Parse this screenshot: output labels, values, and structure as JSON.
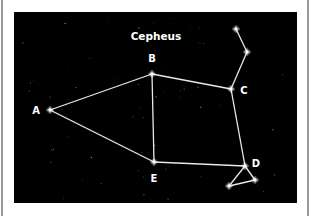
{
  "diagram": {
    "title": "Cepheus",
    "background_color": "#000000",
    "line_color": "#e8e8e8",
    "star_color": "#ffffff",
    "stars": [
      {
        "id": "A",
        "label": "A",
        "x": 50,
        "y": 110,
        "label_x": 36,
        "label_y": 114
      },
      {
        "id": "B",
        "label": "B",
        "x": 152,
        "y": 74,
        "label_x": 152,
        "label_y": 62
      },
      {
        "id": "C",
        "label": "C",
        "x": 231,
        "y": 89,
        "label_x": 244,
        "label_y": 94
      },
      {
        "id": "D",
        "label": "D",
        "x": 245,
        "y": 166,
        "label_x": 256,
        "label_y": 167
      },
      {
        "id": "E",
        "label": "E",
        "x": 154,
        "y": 162,
        "label_x": 154,
        "label_y": 182
      },
      {
        "id": "c1",
        "label": "",
        "x": 247,
        "y": 52
      },
      {
        "id": "c2",
        "label": "",
        "x": 236,
        "y": 29
      },
      {
        "id": "d1",
        "label": "",
        "x": 255,
        "y": 180
      },
      {
        "id": "d2",
        "label": "",
        "x": 229,
        "y": 186
      }
    ],
    "connections": [
      [
        "A",
        "B"
      ],
      [
        "A",
        "E"
      ],
      [
        "B",
        "C"
      ],
      [
        "B",
        "E"
      ],
      [
        "C",
        "D"
      ],
      [
        "E",
        "D"
      ],
      [
        "C",
        "c1"
      ],
      [
        "c1",
        "c2"
      ],
      [
        "D",
        "d1"
      ],
      [
        "d1",
        "d2"
      ],
      [
        "d2",
        "D"
      ]
    ]
  }
}
